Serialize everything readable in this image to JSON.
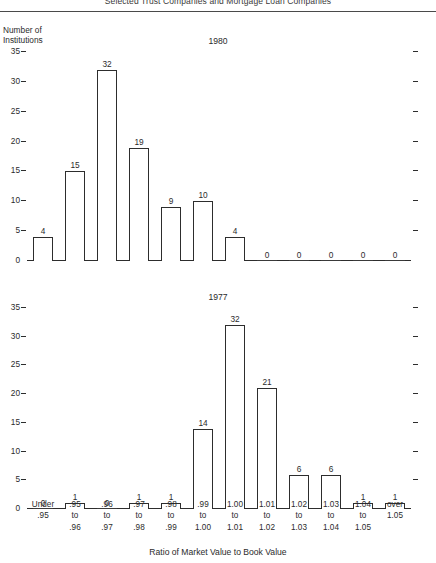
{
  "figure": {
    "title": "Selected Trust Companies and Mortgage Loan Companies",
    "y_axis_label_line1": "Number of",
    "y_axis_label_line2": "Institutions",
    "x_axis_title": "Ratio of Market Value to Book Value",
    "panel_top_label": "1980",
    "panel_bottom_label": "1977"
  },
  "chart_data": [
    {
      "type": "bar",
      "title": "1980",
      "xlabel": "Ratio of Market Value to Book Value",
      "ylabel": "Number of Institutions",
      "ylim": [
        0,
        36
      ],
      "yticks": [
        0,
        5,
        10,
        15,
        20,
        25,
        30,
        35
      ],
      "grid": false,
      "legend": "none",
      "categories": [
        "Under .95",
        ".95 to .96",
        ".96 to .97",
        ".97 to .98",
        ".98 to .99",
        ".99 to 1.00",
        "1.00 to 1.01",
        "1.01 to 1.02",
        "1.02 to 1.03",
        "1.03 to 1.04",
        "1.04 to 1.05",
        "over 1.05"
      ],
      "values": [
        4,
        15,
        32,
        19,
        9,
        10,
        4,
        0,
        0,
        0,
        0,
        0
      ]
    },
    {
      "type": "bar",
      "title": "1977",
      "xlabel": "Ratio of Market Value to Book Value",
      "ylabel": "Number of Institutions",
      "ylim": [
        0,
        36
      ],
      "yticks": [
        0,
        5,
        10,
        15,
        20,
        25,
        30,
        35
      ],
      "grid": false,
      "legend": "none",
      "categories": [
        "Under .95",
        ".95 to .96",
        ".96 to .97",
        ".97 to .98",
        ".98 to .99",
        ".99 to 1.00",
        "1.00 to 1.01",
        "1.01 to 1.02",
        "1.02 to 1.03",
        "1.03 to 1.04",
        "1.04 to 1.05",
        "over 1.05"
      ],
      "values": [
        0,
        1,
        0,
        1,
        1,
        14,
        32,
        21,
        6,
        6,
        1,
        1
      ]
    }
  ],
  "x_tick_labels": [
    [
      "Under",
      ".95"
    ],
    [
      ".95",
      "to",
      ".96"
    ],
    [
      ".96",
      "to",
      ".97"
    ],
    [
      ".97",
      "to",
      ".98"
    ],
    [
      ".98",
      "to",
      ".99"
    ],
    [
      ".99",
      "to",
      "1.00"
    ],
    [
      "1.00",
      "to",
      "1.01"
    ],
    [
      "1.01",
      "to",
      "1.02"
    ],
    [
      "1.02",
      "to",
      "1.03"
    ],
    [
      "1.03",
      "to",
      "1.04"
    ],
    [
      "1.04",
      "to",
      "1.05"
    ],
    [
      "over",
      "1.05"
    ]
  ]
}
